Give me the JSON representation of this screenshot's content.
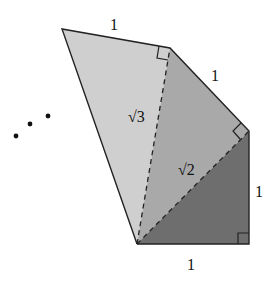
{
  "diagram": {
    "colors": {
      "triangle_1": "#6e6e6e",
      "triangle_2": "#a9a9a9",
      "triangle_3": "#cfcfcf",
      "stroke": "#222222"
    },
    "labels": {
      "bottom_leg": "1",
      "right_leg": "1",
      "slant_leg": "1",
      "top_leg": "1",
      "hyp_sqrt2": "√2",
      "hyp_sqrt3": "√3"
    },
    "continuation": "• • •"
  }
}
